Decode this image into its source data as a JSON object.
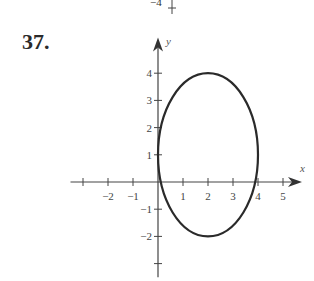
{
  "page": {
    "previous_fragment_label": "−4",
    "problem_number": "37."
  },
  "chart_data": {
    "type": "line",
    "title": "",
    "xlabel": "x",
    "ylabel": "y",
    "xlim": [
      -3.5,
      5.6
    ],
    "ylim": [
      -3.5,
      4.8
    ],
    "grid": false,
    "legend": null,
    "x_ticks": [
      -3,
      -2,
      -1,
      1,
      2,
      3,
      4,
      5
    ],
    "x_tick_labels": [
      "",
      "−2",
      "−1",
      "1",
      "2",
      "3",
      "4",
      "5"
    ],
    "y_ticks": [
      -3,
      -2,
      -1,
      1,
      2,
      3,
      4
    ],
    "y_tick_labels": [
      "",
      "−2",
      "−1",
      "1",
      "2",
      "3",
      "4"
    ],
    "series": [
      {
        "name": "ellipse",
        "shape": "ellipse",
        "center": [
          2,
          1
        ],
        "radius_x": 2,
        "radius_y": 3,
        "equation": "(x−2)²/4 + (y−1)²/9 = 1",
        "key_points": [
          [
            0,
            1
          ],
          [
            4,
            1
          ],
          [
            2,
            4
          ],
          [
            2,
            -2
          ]
        ]
      }
    ]
  }
}
